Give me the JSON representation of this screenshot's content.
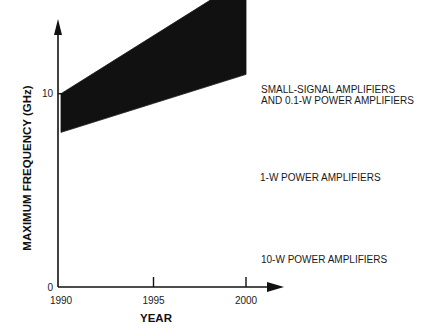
{
  "chart_data": {
    "type": "area",
    "title": "",
    "xlabel": "YEAR",
    "ylabel": "MAXIMUM FREQUENCY (GHz)",
    "x": [
      1990,
      1995,
      2000
    ],
    "xticks": [
      "1990",
      "1995",
      "2000"
    ],
    "yticks": [
      0,
      10,
      20,
      30,
      40,
      50,
      60,
      70,
      80,
      90,
      100,
      110,
      120
    ],
    "xlim": [
      1990,
      2000
    ],
    "ylim": [
      0,
      120
    ],
    "grid": false,
    "legend": "inline labels to the right of each band",
    "ink_color": "#111111",
    "background_color": "#ffffff",
    "series": [
      {
        "name": "SMALL-SIGNAL AMPLIFIERS AND 0.1-W POWER AMPLIFIERS",
        "label_lines": [
          "SMALL-SIGNAL AMPLIFIERS",
          "AND 0.1-W POWER AMPLIFIERS"
        ],
        "style": "outline",
        "upper": [
          59,
          85,
          117
        ],
        "lower": [
          51,
          72,
          83
        ]
      },
      {
        "name": "1-W POWER AMPLIFIERS",
        "label_lines": [
          "1-W POWER AMPLIFIERS"
        ],
        "style": "filled",
        "upper": [
          33,
          50,
          67
        ],
        "lower": [
          28,
          36,
          44
        ]
      },
      {
        "name": "10-W POWER AMPLIFIERS",
        "label_lines": [
          "10-W POWER AMPLIFIERS"
        ],
        "style": "filled",
        "upper": [
          10,
          13,
          16
        ],
        "lower": [
          8,
          9.5,
          11
        ]
      }
    ]
  }
}
